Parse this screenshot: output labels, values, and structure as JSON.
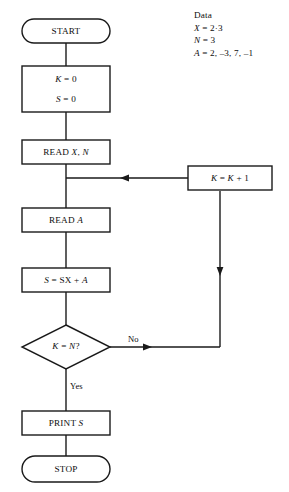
{
  "diagram": {
    "type": "flowchart",
    "nodes": [
      {
        "id": "start",
        "shape": "terminator",
        "text": "START"
      },
      {
        "id": "init",
        "shape": "process",
        "line1": "K = 0",
        "line2": "S = 0"
      },
      {
        "id": "read_xn",
        "shape": "process",
        "text": "READ X, N"
      },
      {
        "id": "read_a",
        "shape": "process",
        "text": "READ A"
      },
      {
        "id": "accum",
        "shape": "process",
        "text": "S = SX + A"
      },
      {
        "id": "test",
        "shape": "decision",
        "text": "K = N?"
      },
      {
        "id": "incr",
        "shape": "process",
        "text": "K = K + 1"
      },
      {
        "id": "print",
        "shape": "process",
        "text": "PRINT S"
      },
      {
        "id": "stop",
        "shape": "terminator",
        "text": "STOP"
      }
    ],
    "edge_labels": {
      "no": "No",
      "yes": "Yes"
    }
  },
  "note": {
    "heading": "Data",
    "lines": [
      "X = 2·3",
      "N = 3",
      "A = 2, –3, 7, –1"
    ]
  },
  "colors": {
    "ink": "#1a1a1a",
    "paper": "#ffffff"
  }
}
